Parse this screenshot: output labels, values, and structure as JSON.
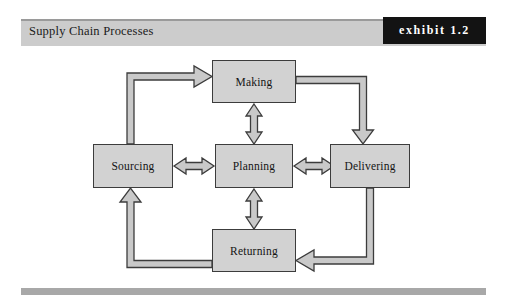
{
  "header": {
    "title": "Supply Chain Processes",
    "exhibit_label": "exhibit 1.2"
  },
  "diagram": {
    "type": "cycle-diagram",
    "nodes": [
      {
        "id": "making",
        "label": "Making"
      },
      {
        "id": "sourcing",
        "label": "Sourcing"
      },
      {
        "id": "planning",
        "label": "Planning"
      },
      {
        "id": "delivering",
        "label": "Delivering"
      },
      {
        "id": "returning",
        "label": "Returning"
      }
    ],
    "connections": [
      {
        "from": "planning",
        "to": "making",
        "style": "double-headed"
      },
      {
        "from": "planning",
        "to": "sourcing",
        "style": "double-headed"
      },
      {
        "from": "planning",
        "to": "delivering",
        "style": "double-headed"
      },
      {
        "from": "planning",
        "to": "returning",
        "style": "double-headed"
      },
      {
        "from": "sourcing",
        "to": "making",
        "style": "elbow-single"
      },
      {
        "from": "making",
        "to": "delivering",
        "style": "elbow-single"
      },
      {
        "from": "delivering",
        "to": "returning",
        "style": "elbow-single"
      },
      {
        "from": "returning",
        "to": "sourcing",
        "style": "elbow-single"
      }
    ]
  },
  "colors": {
    "node_fill": "#d2d2d2",
    "node_border": "#3c3c3c",
    "arrow_fill": "#c9c9c9",
    "header_band": "#cccccc",
    "exhibit_block": "#131313",
    "footer_rule": "#a8a8a8"
  }
}
